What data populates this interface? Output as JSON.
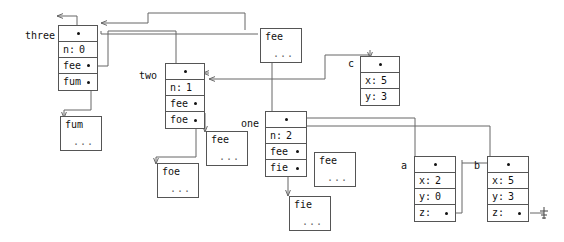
{
  "diagram": {
    "type": "object-memory-diagram",
    "accent_color": "#666666",
    "box_border_color": "#555555",
    "text_color": "#111111",
    "background": "#ffffff"
  },
  "variables": [
    {
      "name": "three",
      "label": "three"
    },
    {
      "name": "two",
      "label": "two"
    },
    {
      "name": "one",
      "label": "one"
    },
    {
      "name": "a",
      "label": "a"
    },
    {
      "name": "b",
      "label": "b"
    },
    {
      "name": "c",
      "label": "c"
    }
  ],
  "objects": {
    "three": {
      "header_dot": "•",
      "rows": [
        {
          "key": "n:",
          "value": "0",
          "pointer": false
        },
        {
          "key": "fee",
          "value": "",
          "pointer": true
        },
        {
          "key": "fum",
          "value": "",
          "pointer": true
        }
      ]
    },
    "two": {
      "header_dot": "•",
      "rows": [
        {
          "key": "n:",
          "value": "1",
          "pointer": false
        },
        {
          "key": "fee",
          "value": "",
          "pointer": true
        },
        {
          "key": "foe",
          "value": "",
          "pointer": true
        }
      ]
    },
    "one": {
      "header_dot": "•",
      "rows": [
        {
          "key": "n:",
          "value": "2",
          "pointer": false
        },
        {
          "key": "fee",
          "value": "",
          "pointer": true
        },
        {
          "key": "fie",
          "value": "",
          "pointer": true
        }
      ]
    },
    "a": {
      "header_dot": "•",
      "rows": [
        {
          "key": "x:",
          "value": "2",
          "pointer": false
        },
        {
          "key": "y:",
          "value": "0",
          "pointer": false
        },
        {
          "key": "z:",
          "value": "",
          "pointer": true
        }
      ]
    },
    "b": {
      "header_dot": "•",
      "rows": [
        {
          "key": "x:",
          "value": "5",
          "pointer": false
        },
        {
          "key": "y:",
          "value": "3",
          "pointer": false
        },
        {
          "key": "z:",
          "value": "",
          "pointer": true
        }
      ]
    },
    "c": {
      "header_dot": "•",
      "rows": [
        {
          "key": "x:",
          "value": "5",
          "pointer": false
        },
        {
          "key": "y:",
          "value": "3",
          "pointer": false
        }
      ]
    }
  },
  "stubs": [
    {
      "id": "fee_top",
      "label": "fee",
      "ellipsis": "..."
    },
    {
      "id": "fum_left",
      "label": "fum",
      "ellipsis": "..."
    },
    {
      "id": "fee_mid",
      "label": "fee",
      "ellipsis": "..."
    },
    {
      "id": "foe_mid",
      "label": "foe",
      "ellipsis": "..."
    },
    {
      "id": "fee_one",
      "label": "fee",
      "ellipsis": "..."
    },
    {
      "id": "fie_one",
      "label": "fie",
      "ellipsis": "..."
    }
  ],
  "ground_symbol": {
    "name": "null-ground-symbol",
    "description": "ground"
  }
}
